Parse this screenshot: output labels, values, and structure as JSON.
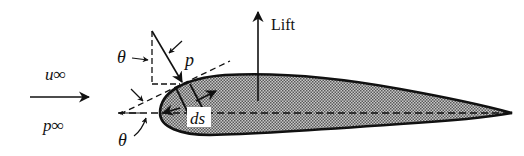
{
  "diagram": {
    "labels": {
      "freestream_velocity": "u∞",
      "freestream_pressure": "p∞",
      "lift": "Lift",
      "pressure": "p",
      "surface_element": "ds",
      "angle_upper": "θ",
      "angle_lower": "θ"
    },
    "colors": {
      "stroke": "#111111",
      "fill_pattern_dark": "#555555",
      "fill_pattern_light": "#d0d0d0",
      "label_background": "#ffffff"
    }
  }
}
